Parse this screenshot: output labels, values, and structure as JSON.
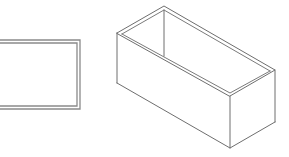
{
  "colors": {
    "background": "#ffffff",
    "line": "#8a8a8a",
    "line_dark": "#6e6e6e"
  },
  "figures": [
    {
      "name": "top-view-rectangle",
      "shape": "double-outline-rectangle",
      "outer": {
        "x": -5,
        "y": 40,
        "right": 80,
        "bottom": 109
      },
      "inner": {
        "x": -5,
        "y": 43,
        "right": 77,
        "bottom": 106
      }
    },
    {
      "name": "isometric-open-box",
      "shape": "isometric-box-open-top",
      "vertices": {
        "top_left": [
          117,
          33
        ],
        "top_back": [
          164,
          6
        ],
        "top_right": [
          275,
          70
        ],
        "top_front": [
          230,
          96
        ],
        "bottom_left": [
          117,
          83
        ],
        "bottom_front": [
          230,
          148
        ],
        "bottom_right": [
          275,
          122
        ]
      }
    }
  ]
}
